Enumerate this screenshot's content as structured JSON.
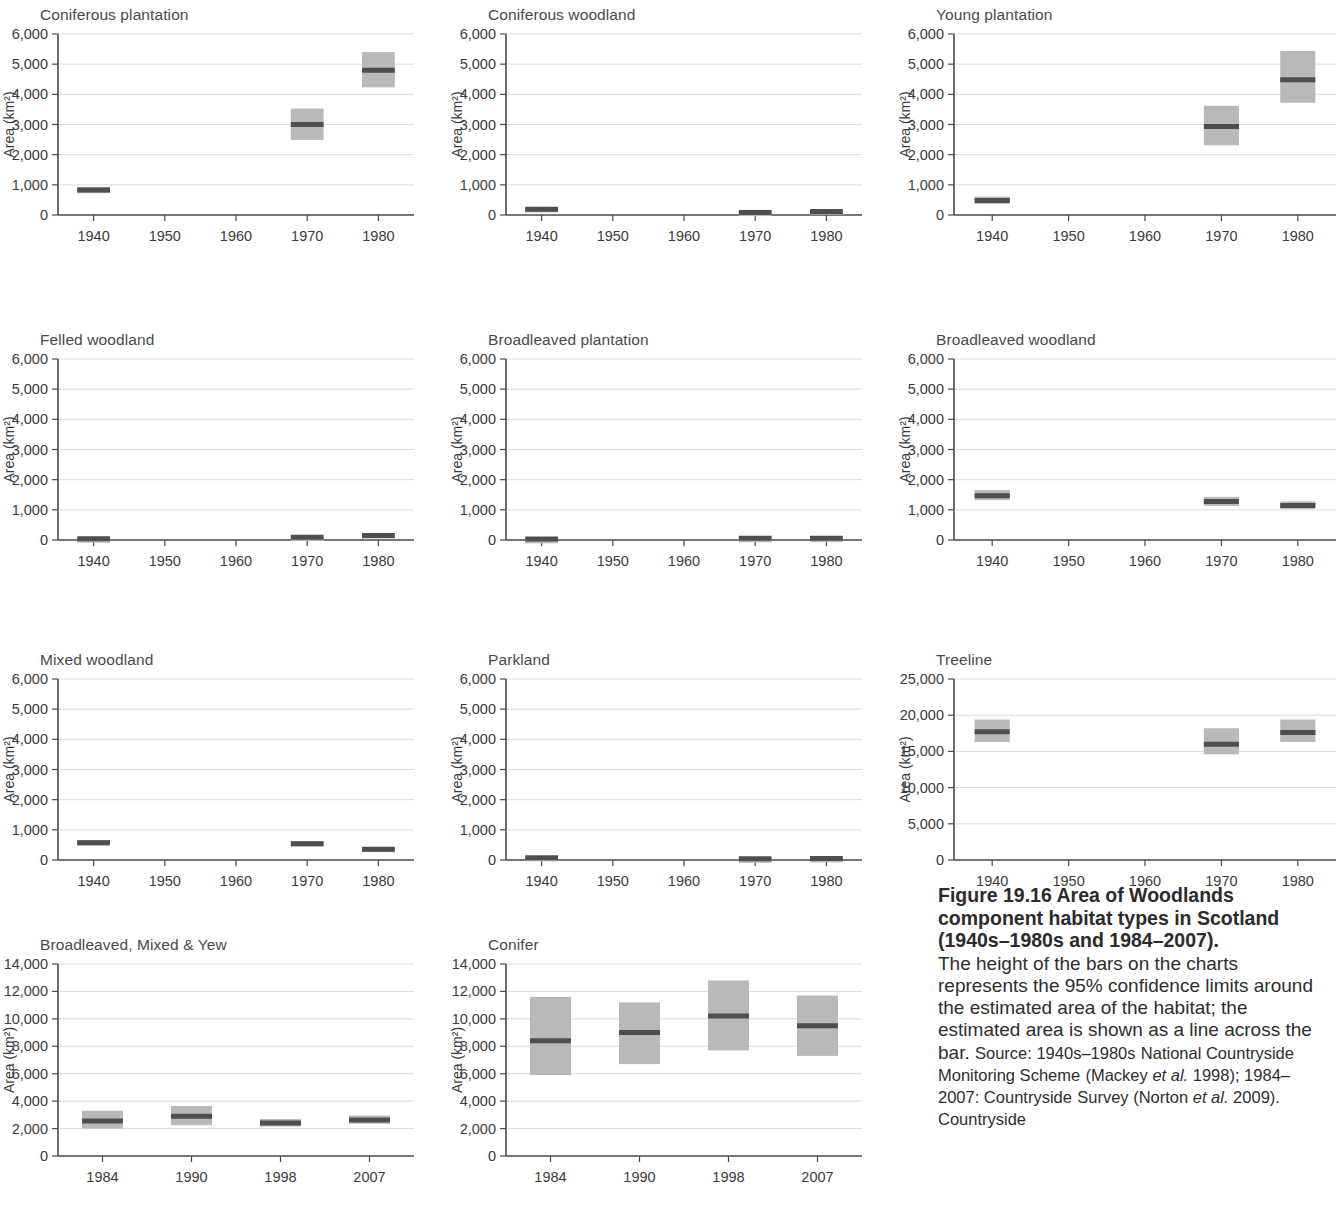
{
  "figure": {
    "caption_heading": "Figure 19.16 Area of Woodlands component habitat types in Scotland (1940s–1980s and 1984–2007).",
    "caption_line1": "The height of the bars on the charts",
    "caption_line2": "represents the 95% confidence limits",
    "caption_line3": "around the estimated area of the",
    "caption_line4": "habitat; the estimated area is shown as",
    "caption_line5a": "a line across the bar. ",
    "caption_line5b": "Source: 1940s–1980s",
    "caption_line6": "National Countryside Monitoring Scheme",
    "caption_line7a": "(Mackey ",
    "caption_line7b": "et al.",
    "caption_line7c": " 1998); 1984–2007: Countryside",
    "caption_line8a": "Survey (Norton ",
    "caption_line8b": "et al.",
    "caption_line8c": " 2009). Countryside",
    "colors": {
      "ci_box": "#b9b9b9",
      "median": "#4e4e4e",
      "axis": "#4a4a4a",
      "grid": "#d8d8d8",
      "title_text": "#4a4a4a"
    }
  },
  "chart_data": [
    {
      "id": "coniferous-plantation",
      "type": "bar",
      "title": "Coniferous plantation",
      "ylabel": "Area (km²)",
      "xlabel": "",
      "ylim": [
        0,
        6000
      ],
      "yticks": [
        0,
        1000,
        2000,
        3000,
        4000,
        5000,
        6000
      ],
      "ytick_labels": [
        "0",
        "1,000",
        "2,000",
        "3,000",
        "4,000",
        "5,000",
        "6,000"
      ],
      "categories": [
        "1940",
        "1950",
        "1960",
        "1970",
        "1980"
      ],
      "xtick_labels": [
        "1940",
        "1950",
        "1960",
        "1970",
        "1980"
      ],
      "values": [
        830,
        null,
        null,
        3000,
        4800
      ],
      "ci_lower": [
        720,
        null,
        null,
        2490,
        4230
      ],
      "ci_upper": [
        930,
        null,
        null,
        3530,
        5400
      ],
      "grid": true
    },
    {
      "id": "coniferous-woodland",
      "type": "bar",
      "title": "Coniferous woodland",
      "ylabel": "Area (km²)",
      "xlabel": "",
      "ylim": [
        0,
        6000
      ],
      "yticks": [
        0,
        1000,
        2000,
        3000,
        4000,
        5000,
        6000
      ],
      "ytick_labels": [
        "0",
        "1,000",
        "2,000",
        "3,000",
        "4,000",
        "5,000",
        "6,000"
      ],
      "categories": [
        "1940",
        "1950",
        "1960",
        "1970",
        "1980"
      ],
      "xtick_labels": [
        "1940",
        "1950",
        "1960",
        "1970",
        "1980"
      ],
      "values": [
        190,
        null,
        null,
        85,
        120
      ],
      "ci_lower": [
        140,
        null,
        null,
        45,
        60
      ],
      "ci_upper": [
        250,
        null,
        null,
        130,
        180
      ],
      "grid": true
    },
    {
      "id": "young-plantation",
      "type": "bar",
      "title": "Young plantation",
      "ylabel": "Area (km²)",
      "xlabel": "",
      "ylim": [
        0,
        6000
      ],
      "yticks": [
        0,
        1000,
        2000,
        3000,
        4000,
        5000,
        6000
      ],
      "ytick_labels": [
        "0",
        "1,000",
        "2,000",
        "3,000",
        "4,000",
        "5,000",
        "6,000"
      ],
      "categories": [
        "1940",
        "1950",
        "1960",
        "1970",
        "1980"
      ],
      "xtick_labels": [
        "1940",
        "1950",
        "1960",
        "1970",
        "1980"
      ],
      "values": [
        480,
        null,
        null,
        2930,
        4480
      ],
      "ci_lower": [
        370,
        null,
        null,
        2310,
        3720
      ],
      "ci_upper": [
        610,
        null,
        null,
        3620,
        5440
      ],
      "grid": true
    },
    {
      "id": "felled-woodland",
      "type": "bar",
      "title": "Felled woodland",
      "ylabel": "Area (km²)",
      "xlabel": "",
      "ylim": [
        0,
        6000
      ],
      "yticks": [
        0,
        1000,
        2000,
        3000,
        4000,
        5000,
        6000
      ],
      "ytick_labels": [
        "0",
        "1,000",
        "2,000",
        "3,000",
        "4,000",
        "5,000",
        "6,000"
      ],
      "categories": [
        "1940",
        "1950",
        "1960",
        "1970",
        "1980"
      ],
      "xtick_labels": [
        "1940",
        "1950",
        "1960",
        "1970",
        "1980"
      ],
      "values": [
        45,
        null,
        null,
        90,
        150
      ],
      "ci_lower": [
        20,
        null,
        null,
        50,
        90
      ],
      "ci_upper": [
        75,
        null,
        null,
        135,
        215
      ],
      "grid": true
    },
    {
      "id": "broadleaved-plantation",
      "type": "bar",
      "title": "Broadleaved plantation",
      "ylabel": "Area (km²)",
      "xlabel": "",
      "ylim": [
        0,
        6000
      ],
      "yticks": [
        0,
        1000,
        2000,
        3000,
        4000,
        5000,
        6000
      ],
      "ytick_labels": [
        "0",
        "1,000",
        "2,000",
        "3,000",
        "4,000",
        "5,000",
        "6,000"
      ],
      "categories": [
        "1940",
        "1950",
        "1960",
        "1970",
        "1980"
      ],
      "xtick_labels": [
        "1940",
        "1950",
        "1960",
        "1970",
        "1980"
      ],
      "values": [
        30,
        null,
        null,
        55,
        60
      ],
      "ci_lower": [
        10,
        null,
        null,
        25,
        30
      ],
      "ci_upper": [
        55,
        null,
        null,
        90,
        95
      ],
      "grid": true
    },
    {
      "id": "broadleaved-woodland",
      "type": "bar",
      "title": "Broadleaved woodland",
      "ylabel": "Area (km²)",
      "xlabel": "",
      "ylim": [
        0,
        6000
      ],
      "yticks": [
        0,
        1000,
        2000,
        3000,
        4000,
        5000,
        6000
      ],
      "ytick_labels": [
        "0",
        "1,000",
        "2,000",
        "3,000",
        "4,000",
        "5,000",
        "6,000"
      ],
      "categories": [
        "1940",
        "1950",
        "1960",
        "1970",
        "1980"
      ],
      "xtick_labels": [
        "1940",
        "1950",
        "1960",
        "1970",
        "1980"
      ],
      "values": [
        1470,
        null,
        null,
        1280,
        1140
      ],
      "ci_lower": [
        1320,
        null,
        null,
        1130,
        1030
      ],
      "ci_upper": [
        1660,
        null,
        null,
        1430,
        1280
      ],
      "grid": true
    },
    {
      "id": "mixed-woodland",
      "type": "bar",
      "title": "Mixed woodland",
      "ylabel": "Area (km²)",
      "xlabel": "",
      "ylim": [
        0,
        6000
      ],
      "yticks": [
        0,
        1000,
        2000,
        3000,
        4000,
        5000,
        6000
      ],
      "ytick_labels": [
        "0",
        "1,000",
        "2,000",
        "3,000",
        "4,000",
        "5,000",
        "6,000"
      ],
      "categories": [
        "1940",
        "1950",
        "1960",
        "1970",
        "1980"
      ],
      "xtick_labels": [
        "1940",
        "1950",
        "1960",
        "1970",
        "1980"
      ],
      "values": [
        570,
        null,
        null,
        540,
        360
      ],
      "ci_lower": [
        480,
        null,
        null,
        450,
        300
      ],
      "ci_upper": [
        660,
        null,
        null,
        630,
        430
      ],
      "grid": true
    },
    {
      "id": "parkland",
      "type": "bar",
      "title": "Parkland",
      "ylabel": "Area (km²)",
      "xlabel": "",
      "ylim": [
        0,
        6000
      ],
      "yticks": [
        0,
        1000,
        2000,
        3000,
        4000,
        5000,
        6000
      ],
      "ytick_labels": [
        "0",
        "1,000",
        "2,000",
        "3,000",
        "4,000",
        "5,000",
        "6,000"
      ],
      "categories": [
        "1940",
        "1950",
        "1960",
        "1970",
        "1980"
      ],
      "xtick_labels": [
        "1940",
        "1950",
        "1960",
        "1970",
        "1980"
      ],
      "values": [
        75,
        null,
        null,
        40,
        50
      ],
      "ci_lower": [
        35,
        null,
        null,
        15,
        20
      ],
      "ci_upper": [
        120,
        null,
        null,
        70,
        85
      ],
      "grid": true
    },
    {
      "id": "treeline",
      "type": "bar",
      "title": "Treeline",
      "ylabel": "Area (km²)",
      "xlabel": "",
      "ylim": [
        0,
        25000
      ],
      "yticks": [
        0,
        5000,
        10000,
        15000,
        20000,
        25000
      ],
      "ytick_labels": [
        "0",
        "5,000",
        "10,000",
        "15,000",
        "20,000",
        "25,000"
      ],
      "categories": [
        "1940",
        "1950",
        "1960",
        "1970",
        "1980"
      ],
      "xtick_labels": [
        "1940",
        "1950",
        "1960",
        "1970",
        "1980"
      ],
      "values": [
        17700,
        null,
        null,
        16000,
        17600
      ],
      "ci_lower": [
        16300,
        null,
        null,
        14600,
        16300
      ],
      "ci_upper": [
        19400,
        null,
        null,
        18200,
        19400
      ],
      "grid": true
    },
    {
      "id": "broadleaved-mixed-yew",
      "type": "bar",
      "title": "Broadleaved, Mixed & Yew",
      "ylabel": "Area (km²)",
      "xlabel": "",
      "ylim": [
        0,
        14000
      ],
      "yticks": [
        0,
        2000,
        4000,
        6000,
        8000,
        10000,
        12000,
        14000
      ],
      "ytick_labels": [
        "0",
        "2,000",
        "4,000",
        "6,000",
        "8,000",
        "10,000",
        "12,000",
        "14,000"
      ],
      "categories": [
        "1984",
        "1990",
        "1998",
        "2007"
      ],
      "xtick_labels": [
        "1984",
        "1990",
        "1998",
        "2007"
      ],
      "values": [
        2550,
        2900,
        2400,
        2630
      ],
      "ci_lower": [
        2000,
        2250,
        2150,
        2350
      ],
      "ci_upper": [
        3300,
        3650,
        2700,
        2950
      ],
      "grid": true
    },
    {
      "id": "conifer",
      "type": "bar",
      "title": "Conifer",
      "ylabel": "Area (km²)",
      "xlabel": "",
      "ylim": [
        0,
        14000
      ],
      "yticks": [
        0,
        2000,
        4000,
        6000,
        8000,
        10000,
        12000,
        14000
      ],
      "ytick_labels": [
        "0",
        "2,000",
        "4,000",
        "6,000",
        "8,000",
        "10,000",
        "12,000",
        "14,000"
      ],
      "categories": [
        "1984",
        "1990",
        "1998",
        "2007"
      ],
      "xtick_labels": [
        "1984",
        "1990",
        "1998",
        "2007"
      ],
      "values": [
        8400,
        9000,
        10200,
        9500
      ],
      "ci_lower": [
        5900,
        6700,
        7700,
        7300
      ],
      "ci_upper": [
        11600,
        11200,
        12800,
        11700
      ],
      "grid": true
    }
  ],
  "layout": {
    "panels": [
      {
        "chart": 0,
        "left": 0,
        "top": 6,
        "w": 420,
        "h": 235,
        "cols": 5
      },
      {
        "chart": 1,
        "left": 448,
        "top": 6,
        "w": 420,
        "h": 235,
        "cols": 5
      },
      {
        "chart": 2,
        "left": 896,
        "top": 6,
        "w": 446,
        "h": 235,
        "cols": 5
      },
      {
        "chart": 3,
        "left": 0,
        "top": 331,
        "w": 420,
        "h": 235,
        "cols": 5
      },
      {
        "chart": 4,
        "left": 448,
        "top": 331,
        "w": 420,
        "h": 235,
        "cols": 5
      },
      {
        "chart": 5,
        "left": 896,
        "top": 331,
        "w": 446,
        "h": 235,
        "cols": 5
      },
      {
        "chart": 6,
        "left": 0,
        "top": 651,
        "w": 420,
        "h": 235,
        "cols": 5
      },
      {
        "chart": 7,
        "left": 448,
        "top": 651,
        "w": 420,
        "h": 235,
        "cols": 5
      },
      {
        "chart": 8,
        "left": 896,
        "top": 651,
        "w": 446,
        "h": 235,
        "cols": 5
      },
      {
        "chart": 9,
        "left": 0,
        "top": 936,
        "w": 420,
        "h": 246,
        "cols": 4
      },
      {
        "chart": 10,
        "left": 448,
        "top": 936,
        "w": 420,
        "h": 246,
        "cols": 4
      }
    ]
  }
}
